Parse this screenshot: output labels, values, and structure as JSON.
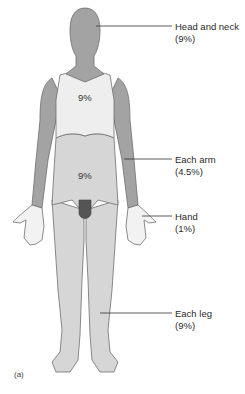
{
  "figure": {
    "panel_label": "(a)",
    "colors": {
      "head_arms": "#a3a3a3",
      "chest": "#eeeeee",
      "abdomen_legs": "#d6d6d6",
      "genitals": "#555555",
      "outline": "#6e6e6e",
      "leader_line": "#333333"
    },
    "regions": [
      {
        "id": "head-and-neck",
        "label": "Head and neck",
        "value": "(9%)"
      },
      {
        "id": "each-arm",
        "label": "Each arm",
        "value": "(4.5%)"
      },
      {
        "id": "hand",
        "label": "Hand",
        "value": "(1%)"
      },
      {
        "id": "each-leg",
        "label": "Each leg",
        "value": "(9%)"
      }
    ],
    "body_annotations": [
      {
        "id": "chest",
        "value": "9%"
      },
      {
        "id": "abdomen",
        "value": "9%"
      }
    ]
  }
}
